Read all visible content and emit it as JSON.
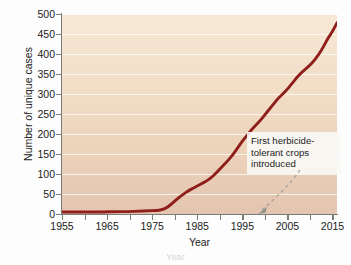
{
  "chart_data": {
    "type": "line",
    "title": "",
    "subtitle": "",
    "xlabel": "Year",
    "ylabel": "Number of unique cases",
    "xlim": [
      1955,
      2016
    ],
    "ylim": [
      0,
      500
    ],
    "grid": true,
    "legend_position": "none",
    "y_ticks": [
      0,
      50,
      100,
      150,
      200,
      250,
      300,
      350,
      400,
      450,
      500
    ],
    "x_ticks": [
      1955,
      1965,
      1975,
      1985,
      1995,
      2005,
      2015
    ],
    "x_minor_tick_step": 5,
    "line_color": "#8f1f1a",
    "plot_background_top": "#f7e9d6",
    "plot_background_bottom": "#e3c4b0",
    "series": [
      {
        "name": "Unique cases of herbicide resistance",
        "x": [
          1955,
          1958,
          1961,
          1964,
          1967,
          1970,
          1972,
          1974,
          1976,
          1977,
          1978,
          1979,
          1980,
          1981,
          1982,
          1983,
          1984,
          1985,
          1986,
          1987,
          1988,
          1989,
          1990,
          1991,
          1992,
          1993,
          1994,
          1995,
          1996,
          1997,
          1998,
          1999,
          2000,
          2001,
          2002,
          2003,
          2004,
          2005,
          2006,
          2007,
          2008,
          2009,
          2010,
          2011,
          2012,
          2013,
          2014,
          2015,
          2016
        ],
        "y": [
          5,
          5,
          5,
          5,
          6,
          6,
          7,
          8,
          9,
          10,
          14,
          22,
          32,
          42,
          50,
          58,
          64,
          70,
          76,
          82,
          90,
          100,
          112,
          124,
          136,
          150,
          166,
          182,
          196,
          210,
          222,
          234,
          248,
          262,
          276,
          290,
          300,
          312,
          326,
          340,
          352,
          362,
          372,
          384,
          400,
          418,
          440,
          456,
          478
        ]
      }
    ],
    "annotations": [
      {
        "name": "first-herbicide-tolerant-crops",
        "text_lines": [
          "First herbicide-",
          "tolerant crops",
          "introduced"
        ],
        "text": "First herbicide-tolerant crops introduced",
        "points_to_year": 1996,
        "points_to_value": 0,
        "arrow_style": "dashed-curve"
      }
    ]
  },
  "axes": {
    "y_title": "Number of unique cases",
    "x_title": "Year",
    "y_tick_labels": [
      "0",
      "50",
      "100",
      "150",
      "200",
      "250",
      "300",
      "350",
      "400",
      "450",
      "500"
    ],
    "x_tick_labels": [
      "1955",
      "1965",
      "1975",
      "1985",
      "1995",
      "2005",
      "2015"
    ]
  },
  "annotation": {
    "line1": "First herbicide-",
    "line2": "tolerant crops",
    "line3": "introduced"
  },
  "caption_remnant": "Year"
}
